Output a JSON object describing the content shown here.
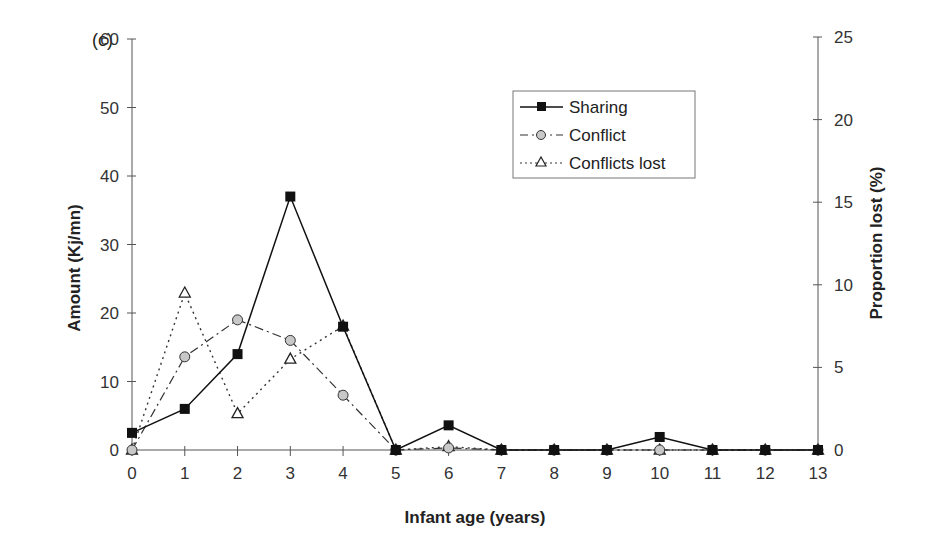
{
  "panel_label": "(c)",
  "colors": {
    "axis": "#555555",
    "sharing": "#111111",
    "conflict_fill": "#c8c8c8",
    "conflict_line": "#333333",
    "lost": "#333333"
  },
  "chart_data": {
    "type": "line",
    "title": "",
    "xlabel": "Infant age (years)",
    "ylabel": "Amount (Kj/mn)",
    "y2label": "Proportion lost (%)",
    "x": [
      0,
      1,
      2,
      3,
      4,
      5,
      6,
      7,
      8,
      9,
      10,
      11,
      12,
      13
    ],
    "x_tick_labels": [
      "0",
      "1",
      "2",
      "3",
      "4",
      "5",
      "6",
      "7",
      "8",
      "9",
      "10",
      "11",
      "12",
      "13"
    ],
    "ylim": [
      0,
      60
    ],
    "y_ticks": [
      0,
      10,
      20,
      30,
      40,
      50,
      60
    ],
    "y2lim": [
      0,
      25
    ],
    "y2_ticks": [
      0,
      5,
      10,
      15,
      20,
      25
    ],
    "grid": false,
    "legend_position": "upper right (inside)",
    "series": [
      {
        "name": "Sharing",
        "axis": "left",
        "marker": "filled-square",
        "line": "solid",
        "values": [
          2.5,
          6.0,
          14.0,
          37.0,
          18.0,
          0,
          3.6,
          0,
          0,
          0,
          1.9,
          0,
          0,
          0
        ]
      },
      {
        "name": "Conflict",
        "axis": "left",
        "marker": "grey-circle",
        "line": "dash-dot",
        "values": [
          0,
          13.6,
          19.0,
          16.0,
          8.0,
          0,
          0.3,
          0,
          0,
          0,
          0,
          0,
          0,
          0
        ]
      },
      {
        "name": "Conflicts lost",
        "axis": "right",
        "marker": "open-triangle",
        "line": "dotted",
        "values": [
          0,
          9.5,
          2.2,
          5.5,
          7.5,
          0,
          0.2,
          0,
          0,
          0,
          0,
          0,
          0,
          0
        ]
      }
    ]
  }
}
